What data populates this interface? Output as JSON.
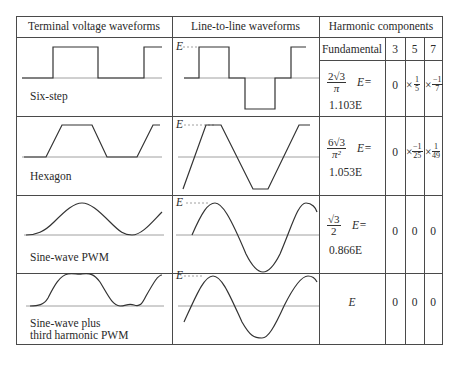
{
  "table": {
    "headers": {
      "terminal": "Terminal voltage waveforms",
      "line_to_line": "Line-to-line waveforms",
      "harmonic": "Harmonic components"
    },
    "subheaders": {
      "fundamental": "Fundamental",
      "h3": "3",
      "h5": "5",
      "h7": "7"
    },
    "axis_label": "E",
    "rows": [
      {
        "name": "Six-step",
        "fundamental_expr": {
          "num": "2√3",
          "den": "π",
          "suffix": "E="
        },
        "fundamental_value": "1.103E",
        "h3": "0",
        "h5": {
          "prefix": "×",
          "num": "1",
          "den": "5"
        },
        "h7": {
          "prefix": "×",
          "num": "−1",
          "den": "7"
        }
      },
      {
        "name": "Hexagon",
        "fundamental_expr": {
          "num": "6√3",
          "den": "π²",
          "suffix": "E="
        },
        "fundamental_value": "1.053E",
        "h3": "0",
        "h5": {
          "prefix": "×",
          "num": "−1",
          "den": "25"
        },
        "h7": {
          "prefix": "×",
          "num": "1",
          "den": "49"
        }
      },
      {
        "name": "Sine-wave PWM",
        "fundamental_expr": {
          "num": "√3",
          "den": "2",
          "suffix": "E="
        },
        "fundamental_value": "0.866E",
        "h3": "0",
        "h5": "0",
        "h7": "0"
      },
      {
        "name_line1": "Sine-wave plus",
        "name_line2": "third harmonic PWM",
        "fundamental_value": "E",
        "h3": "0",
        "h5": "0",
        "h7": "0"
      }
    ]
  }
}
